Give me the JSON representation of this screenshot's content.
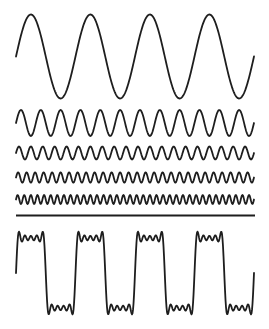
{
  "diagram": {
    "title": "",
    "x_start": 16,
    "x_end": 254,
    "fundamental_period_px": 59.5,
    "stroke_color": "#1e1e1e",
    "background": "#ffffff",
    "harmonics": [
      {
        "name": "harmonic-1",
        "order": 1,
        "center_y": 56.5,
        "amplitude": 42
      },
      {
        "name": "harmonic-3",
        "order": 3,
        "center_y": 123,
        "amplitude": 13
      },
      {
        "name": "harmonic-5",
        "order": 5,
        "center_y": 153,
        "amplitude": 6.5
      },
      {
        "name": "harmonic-7",
        "order": 7,
        "center_y": 177.5,
        "amplitude": 5.2
      },
      {
        "name": "harmonic-9",
        "order": 9,
        "center_y": 199.5,
        "amplitude": 4.5
      }
    ],
    "divider": {
      "y": 215.5,
      "x1": 16,
      "x2": 255
    },
    "sum_wave": {
      "name": "square-wave-sum",
      "center_y": 273,
      "amplitude": 35,
      "orders": [
        1,
        3,
        5,
        7,
        9
      ]
    }
  }
}
